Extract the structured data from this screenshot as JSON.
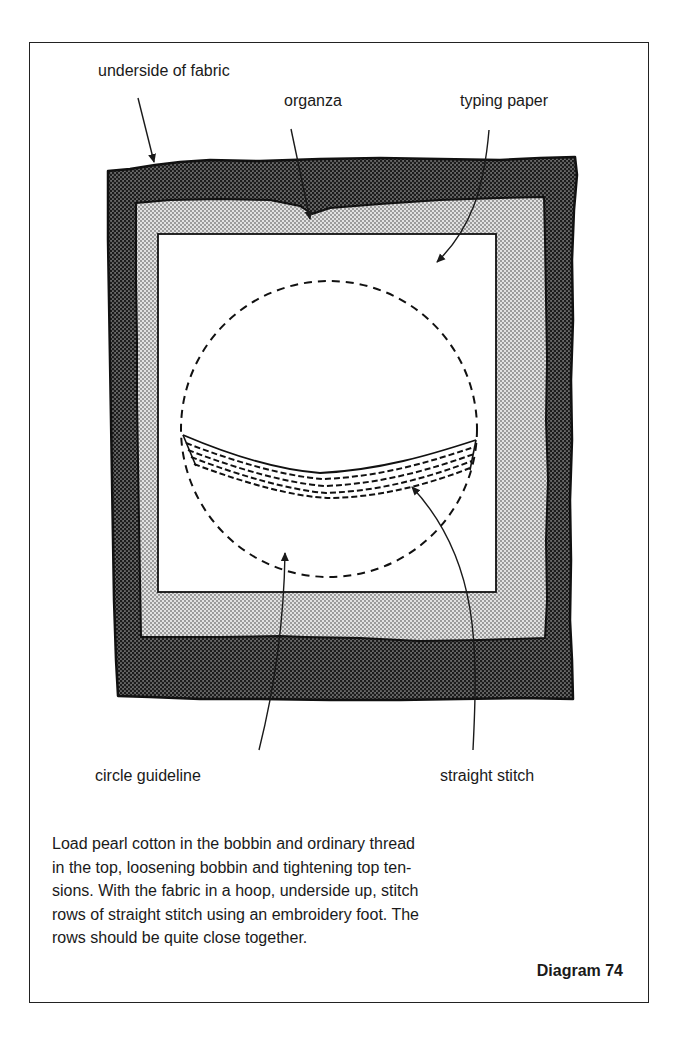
{
  "figure": {
    "number_label": "Diagram 74",
    "labels": {
      "underside_of_fabric": "underside of fabric",
      "organza": "organza",
      "typing_paper": "typing paper",
      "circle_guideline": "circle guideline",
      "straight_stitch": "straight stitch"
    },
    "caption_lines": [
      "Load pearl cotton in the bobbin and ordinary thread",
      "in the top, loosening bobbin and tightening top ten-",
      "sions. With the fabric in a hoop, underside up, stitch",
      "rows of straight stitch using an embroidery foot. The",
      "rows should be quite close together."
    ],
    "layers": [
      {
        "name": "underside of fabric",
        "shade": "dark halftone",
        "color": "#4a4a4a"
      },
      {
        "name": "organza",
        "shade": "light halftone",
        "color": "#c4c4c4"
      },
      {
        "name": "typing paper",
        "shade": "white",
        "color": "#ffffff"
      }
    ],
    "colors": {
      "ink": "#1a1a1a",
      "paper": "#ffffff",
      "dark_fill": "#4a4a4a",
      "light_fill": "#c4c4c4"
    }
  }
}
